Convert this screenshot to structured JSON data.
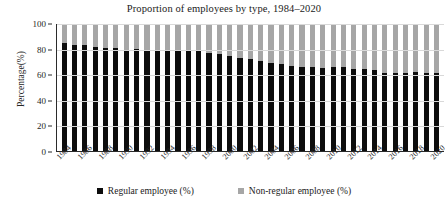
{
  "chart_data": {
    "type": "bar",
    "subtype": "stacked-100-percent",
    "title": "Proportion of employees by type, 1984–2020",
    "xlabel": "",
    "ylabel": "Percentage(%)",
    "ylim": [
      0,
      100
    ],
    "ytick_values": [
      0,
      20,
      40,
      60,
      80,
      100
    ],
    "ytick_labels": [
      "0",
      "20",
      "40",
      "60",
      "80",
      "100"
    ],
    "grid": true,
    "legend_position": "bottom",
    "categories": [
      "1984",
      "1985",
      "1986",
      "1987",
      "1988",
      "1989",
      "1990",
      "1991",
      "1992",
      "1993",
      "1994",
      "1995",
      "1996",
      "1997",
      "1998",
      "1999",
      "2000",
      "2001",
      "2002",
      "2003",
      "2004",
      "2005",
      "2006",
      "2007",
      "2008",
      "2009",
      "2010",
      "2011",
      "2012",
      "2013",
      "2014",
      "2015",
      "2016",
      "2017",
      "2018",
      "2019",
      "2020"
    ],
    "xtick_labels": [
      "1984",
      "",
      "1986",
      "",
      "1988",
      "",
      "1990",
      "",
      "1992",
      "",
      "1994",
      "",
      "1996",
      "",
      "1998",
      "",
      "2000",
      "",
      "2002",
      "",
      "2004",
      "",
      "2006",
      "",
      "2008",
      "",
      "2010",
      "",
      "2012",
      "",
      "2014",
      "",
      "2016",
      "",
      "2018",
      "",
      "2020"
    ],
    "series": [
      {
        "name": "Regular employee (%)",
        "color": "#0d0d0d",
        "values": [
          84.7,
          83.4,
          83.4,
          82.1,
          81.4,
          80.9,
          79.8,
          80.1,
          79.2,
          79.1,
          79.4,
          79.1,
          78.9,
          78.5,
          77.0,
          76.4,
          74.8,
          73.5,
          72.2,
          70.7,
          69.3,
          68.2,
          67.2,
          66.3,
          65.9,
          65.6,
          66.3,
          65.8,
          64.3,
          64.4,
          63.4,
          61.5,
          61.8,
          61.8,
          62.2,
          61.3,
          61.4
        ]
      },
      {
        "name": "Non-regular employee (%)",
        "color": "#a6a6a6",
        "values": [
          15.3,
          16.6,
          16.6,
          17.9,
          18.6,
          19.1,
          20.2,
          19.9,
          20.8,
          20.9,
          20.6,
          20.9,
          21.1,
          21.5,
          23.0,
          23.6,
          25.2,
          26.5,
          27.8,
          29.3,
          30.7,
          31.8,
          32.8,
          33.7,
          34.1,
          34.4,
          33.7,
          34.2,
          35.7,
          35.6,
          36.6,
          38.5,
          38.2,
          38.2,
          37.8,
          38.7,
          38.6
        ]
      }
    ]
  },
  "legend": {
    "items": [
      {
        "label": "Regular employee (%)",
        "color": "#0d0d0d"
      },
      {
        "label": "Non-regular employee (%)",
        "color": "#a6a6a6"
      }
    ]
  }
}
